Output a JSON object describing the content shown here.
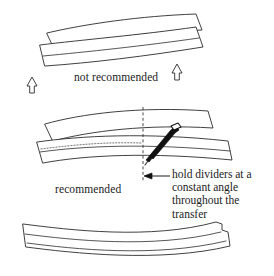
{
  "figure": {
    "background_color": "#ffffff",
    "ink_color": "#2b2b2b"
  },
  "panels": {
    "top": {
      "caption": "not recommended",
      "arrows": [
        {
          "name": "gap-arrow-left",
          "label": "⇧"
        },
        {
          "name": "gap-arrow-right",
          "label": "⇧"
        }
      ]
    },
    "middle": {
      "caption": "recommended",
      "callout": {
        "lines": [
          "hold dividers at a",
          "constant angle",
          "throughout the",
          "transfer"
        ]
      }
    },
    "bottom": {
      "caption": ""
    }
  }
}
